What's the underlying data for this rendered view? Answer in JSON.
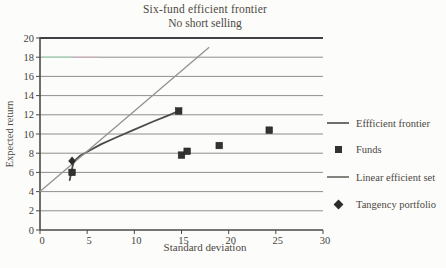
{
  "figure": {
    "title": "Six-fund efficient frontier",
    "subtitle": "No short selling"
  },
  "chart_data": {
    "type": "scatter",
    "title": "Six-fund efficient frontier",
    "subtitle": "No short selling",
    "xlabel": "Standard deviation",
    "ylabel": "Expected return",
    "xlim": [
      0,
      30
    ],
    "ylim": [
      0,
      20
    ],
    "xticks": [
      0,
      5,
      10,
      15,
      20,
      25,
      30
    ],
    "yticks": [
      0,
      2,
      4,
      6,
      8,
      10,
      12,
      14,
      16,
      18,
      20
    ],
    "grid": "horizontal",
    "legend_position": "right",
    "series": [
      {
        "name": "Efficient frontier",
        "type": "line",
        "color": "#4b4b49",
        "width": 1.8,
        "points": [
          [
            3.15,
            5.2
          ],
          [
            3.3,
            5.9
          ],
          [
            3.45,
            6.6
          ],
          [
            3.6,
            7.15
          ],
          [
            4.2,
            7.7
          ],
          [
            5.2,
            8.25
          ],
          [
            6.5,
            8.95
          ],
          [
            8,
            9.6
          ],
          [
            10,
            10.45
          ],
          [
            12,
            11.3
          ],
          [
            13.5,
            11.9
          ],
          [
            14.7,
            12.4
          ]
        ]
      },
      {
        "name": "Funds",
        "type": "scatter",
        "marker": "square",
        "color": "#323230",
        "points": [
          [
            3.4,
            6.0
          ],
          [
            14.7,
            12.4
          ],
          [
            15.0,
            7.8
          ],
          [
            15.6,
            8.2
          ],
          [
            19.0,
            8.8
          ],
          [
            24.3,
            10.4
          ]
        ]
      },
      {
        "name": "Linear efficient set",
        "type": "line",
        "color": "#929290",
        "width": 1.3,
        "points": [
          [
            0,
            4
          ],
          [
            17.9,
            19.0
          ]
        ]
      },
      {
        "name": "Tangency portfolio",
        "type": "scatter",
        "marker": "diamond",
        "color": "#2c2c2a",
        "points": [
          [
            3.4,
            7.2
          ]
        ]
      }
    ]
  },
  "legend": {
    "items": [
      {
        "label": "Effficient frontier",
        "marker": "line",
        "color": "#6e6e6c"
      },
      {
        "label": "Funds",
        "marker": "square",
        "color": "#323230"
      },
      {
        "label": "Linear efficient set",
        "marker": "line",
        "color": "#84847f"
      },
      {
        "label": "Tangency portfolio",
        "marker": "diamond",
        "color": "#2c2c2a"
      }
    ]
  },
  "colors": {
    "background": "#fcfcfa",
    "grid": "#81817f",
    "top_border": "#3f3f45",
    "axis": "#4a4a48",
    "text": "#4c483f",
    "scan_artifact_green": "#a9dabb",
    "scan_artifact_pink": "#d9b2c6"
  }
}
